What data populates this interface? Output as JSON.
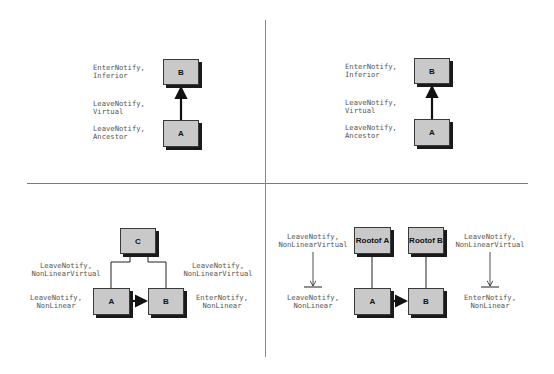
{
  "figure": {
    "quadrants": [
      {
        "id": "top-left",
        "boxes": [
          {
            "id": "B",
            "label": "B"
          },
          {
            "id": "A",
            "label": "A"
          }
        ],
        "labels": [
          {
            "line1": "EnterNotify,",
            "line2": "Inferior"
          },
          {
            "line1": "LeaveNotify,",
            "line2": "Virtual"
          },
          {
            "line1": "LeaveNotify,",
            "line2": "Ancestor"
          }
        ]
      },
      {
        "id": "top-right",
        "boxes": [
          {
            "id": "B",
            "label": "B"
          },
          {
            "id": "A",
            "label": "A"
          }
        ],
        "labels": [
          {
            "line1": "EnterNotify,",
            "line2": "Inferior"
          },
          {
            "line1": "LeaveNotify,",
            "line2": "Virtual"
          },
          {
            "line1": "LeaveNotify,",
            "line2": "Ancestor"
          }
        ]
      },
      {
        "id": "bottom-left",
        "boxes": [
          {
            "id": "C",
            "label": "C"
          },
          {
            "id": "A",
            "label": "A"
          },
          {
            "id": "B",
            "label": "B"
          }
        ],
        "labels": [
          {
            "line1": "LeaveNotify,",
            "line2": "NonLinearVirtual"
          },
          {
            "line1": "LeaveNotify,",
            "line2": "NonLinearVirtual"
          },
          {
            "line1": "LeaveNotify,",
            "line2": "NonLinear"
          },
          {
            "line1": "EnterNotify,",
            "line2": "NonLinear"
          }
        ]
      },
      {
        "id": "bottom-right",
        "boxes": [
          {
            "id": "RootA",
            "line1": "Root",
            "line2": "of A"
          },
          {
            "id": "RootB",
            "line1": "Root",
            "line2": "of B"
          },
          {
            "id": "A",
            "label": "A"
          },
          {
            "id": "B",
            "label": "B"
          }
        ],
        "labels": [
          {
            "line1": "LeaveNotify,",
            "line2": "NonLinearVirtual"
          },
          {
            "line1": "LeaveNotify,",
            "line2": "NonLinearVirtual"
          },
          {
            "line1": "LeaveNotify,",
            "line2": "NonLinear"
          },
          {
            "line1": "EnterNotify,",
            "line2": "NonLinear"
          }
        ]
      }
    ],
    "colors": {
      "box_fill": "#c9c9c9",
      "box_border": "#3a3a3a",
      "shadow": "#1a1a1a",
      "label_text": "#555555",
      "divider": "#7a7a7a"
    }
  }
}
